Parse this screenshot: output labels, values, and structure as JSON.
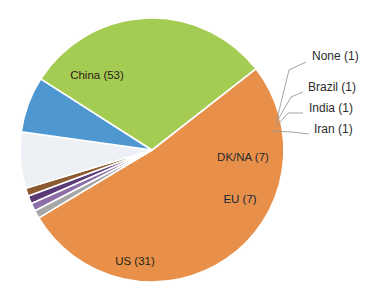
{
  "chart_data": {
    "type": "pie",
    "title": "",
    "subtitle": "",
    "xlabel": "",
    "ylabel": "",
    "legend_position": "none",
    "grid": false,
    "total": 102,
    "categories": [
      "China",
      "None",
      "Brazil",
      "India",
      "Iran",
      "DK/NA",
      "EU",
      "US"
    ],
    "values": [
      53,
      1,
      1,
      1,
      1,
      7,
      7,
      31
    ],
    "labels": [
      "China (53)",
      "None (1)",
      "Brazil (1)",
      "India (1)",
      "Iran (1)",
      "DK/NA (7)",
      "EU (7)",
      "US (31)"
    ],
    "colors": [
      "#E8904A",
      "#A6A6A6",
      "#8C6FA8",
      "#5B3A78",
      "#8C5A30",
      "#EDF1F6",
      "#4E97D1",
      "#A5CC52"
    ],
    "slices": [
      {
        "name": "China",
        "label": "China (53)",
        "value": 53,
        "color": "#E8904A",
        "label_placement": "inside",
        "label_x": 97,
        "label_y": 76
      },
      {
        "name": "None",
        "label": "None (1)",
        "value": 1,
        "color": "#A6A6A6",
        "label_placement": "callout",
        "label_x": 312,
        "label_y": 57
      },
      {
        "name": "Brazil",
        "label": "Brazil (1)",
        "value": 1,
        "color": "#8C6FA8",
        "label_placement": "callout",
        "label_x": 308,
        "label_y": 88
      },
      {
        "name": "India",
        "label": "India (1)",
        "value": 1,
        "color": "#5B3A78",
        "label_placement": "callout",
        "label_x": 309,
        "label_y": 109
      },
      {
        "name": "Iran",
        "label": "Iran (1)",
        "value": 1,
        "color": "#8C5A30",
        "label_placement": "callout",
        "label_x": 314,
        "label_y": 130
      },
      {
        "name": "DK/NA",
        "label": "DK/NA (7)",
        "value": 7,
        "color": "#EDF1F6",
        "label_placement": "inside",
        "label_x": 243,
        "label_y": 158
      },
      {
        "name": "EU",
        "label": "EU (7)",
        "value": 7,
        "color": "#4E97D1",
        "label_placement": "inside",
        "label_x": 240,
        "label_y": 200
      },
      {
        "name": "US",
        "label": "US (31)",
        "value": 31,
        "color": "#A5CC52",
        "label_placement": "inside",
        "label_x": 135,
        "label_y": 262
      }
    ],
    "geometry": {
      "center_x": 152,
      "center_y": 150,
      "radius": 132,
      "start_angle_deg": 322
    },
    "background_color": "#FFFFFF",
    "separator_color": "#FFFFFF"
  }
}
